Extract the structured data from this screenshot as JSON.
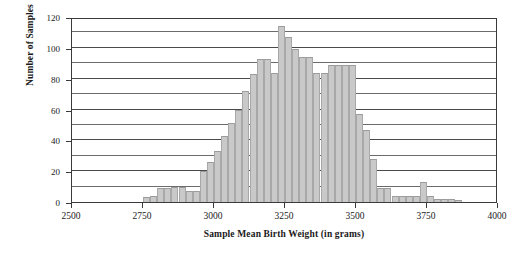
{
  "chart_data": {
    "type": "bar",
    "title": "",
    "xlabel": "Sample Mean Birth Weight (in grams)",
    "ylabel": "Number of Samples",
    "xlim": [
      2500,
      4000
    ],
    "ylim": [
      0,
      120
    ],
    "bin_width": 25,
    "grid": true,
    "grid_axis": "y",
    "legend": null,
    "x_major_ticks": [
      2500,
      2750,
      3000,
      3250,
      3500,
      3750,
      4000
    ],
    "x_tick_labels": [
      "2500",
      "2750",
      "3000",
      "3250",
      "3500",
      "3750",
      "4000"
    ],
    "y_major_ticks": [
      0,
      20,
      40,
      60,
      80,
      100,
      120
    ],
    "y_tick_labels": [
      "0",
      "20",
      "40",
      "60",
      "80",
      "100",
      "120"
    ],
    "y_gridlines": [
      10,
      20,
      30,
      40,
      50,
      60,
      70,
      80,
      90,
      100,
      110,
      120
    ],
    "bar_color": "#c9c9c9",
    "bar_edge_color": "#9b9b9b",
    "axis_color": "#3a3a3a",
    "bins": [
      {
        "x0": 2750,
        "x1": 2775,
        "value": 3
      },
      {
        "x0": 2775,
        "x1": 2800,
        "value": 4
      },
      {
        "x0": 2800,
        "x1": 2825,
        "value": 9
      },
      {
        "x0": 2825,
        "x1": 2850,
        "value": 9
      },
      {
        "x0": 2850,
        "x1": 2875,
        "value": 10
      },
      {
        "x0": 2875,
        "x1": 2900,
        "value": 10
      },
      {
        "x0": 2900,
        "x1": 2925,
        "value": 7
      },
      {
        "x0": 2925,
        "x1": 2950,
        "value": 7
      },
      {
        "x0": 2950,
        "x1": 2975,
        "value": 20
      },
      {
        "x0": 2975,
        "x1": 3000,
        "value": 26
      },
      {
        "x0": 3000,
        "x1": 3025,
        "value": 33
      },
      {
        "x0": 3025,
        "x1": 3050,
        "value": 43
      },
      {
        "x0": 3050,
        "x1": 3075,
        "value": 51
      },
      {
        "x0": 3075,
        "x1": 3100,
        "value": 60
      },
      {
        "x0": 3100,
        "x1": 3125,
        "value": 72
      },
      {
        "x0": 3125,
        "x1": 3150,
        "value": 83
      },
      {
        "x0": 3150,
        "x1": 3175,
        "value": 93
      },
      {
        "x0": 3175,
        "x1": 3200,
        "value": 93
      },
      {
        "x0": 3200,
        "x1": 3225,
        "value": 84
      },
      {
        "x0": 3225,
        "x1": 3250,
        "value": 114
      },
      {
        "x0": 3250,
        "x1": 3275,
        "value": 107
      },
      {
        "x0": 3275,
        "x1": 3300,
        "value": 99
      },
      {
        "x0": 3300,
        "x1": 3325,
        "value": 94
      },
      {
        "x0": 3325,
        "x1": 3350,
        "value": 94
      },
      {
        "x0": 3350,
        "x1": 3375,
        "value": 84
      },
      {
        "x0": 3375,
        "x1": 3400,
        "value": 84
      },
      {
        "x0": 3400,
        "x1": 3425,
        "value": 89
      },
      {
        "x0": 3425,
        "x1": 3450,
        "value": 89
      },
      {
        "x0": 3450,
        "x1": 3475,
        "value": 89
      },
      {
        "x0": 3475,
        "x1": 3500,
        "value": 89
      },
      {
        "x0": 3500,
        "x1": 3525,
        "value": 57
      },
      {
        "x0": 3525,
        "x1": 3550,
        "value": 47
      },
      {
        "x0": 3550,
        "x1": 3575,
        "value": 28
      },
      {
        "x0": 3575,
        "x1": 3600,
        "value": 9
      },
      {
        "x0": 3600,
        "x1": 3625,
        "value": 9
      },
      {
        "x0": 3625,
        "x1": 3650,
        "value": 4
      },
      {
        "x0": 3650,
        "x1": 3675,
        "value": 4
      },
      {
        "x0": 3675,
        "x1": 3700,
        "value": 4
      },
      {
        "x0": 3700,
        "x1": 3725,
        "value": 4
      },
      {
        "x0": 3725,
        "x1": 3750,
        "value": 13
      },
      {
        "x0": 3750,
        "x1": 3775,
        "value": 4
      },
      {
        "x0": 3775,
        "x1": 3800,
        "value": 2
      },
      {
        "x0": 3800,
        "x1": 3825,
        "value": 2
      },
      {
        "x0": 3825,
        "x1": 3850,
        "value": 2
      },
      {
        "x0": 3850,
        "x1": 3875,
        "value": 1
      }
    ]
  }
}
